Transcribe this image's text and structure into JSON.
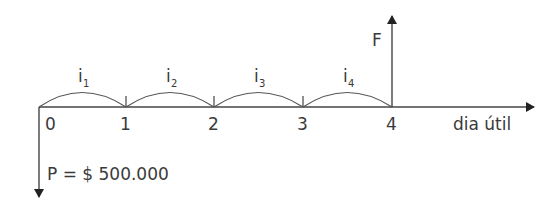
{
  "diagram": {
    "type": "cash-flow-timeline",
    "axis": {
      "label": "dia útil",
      "ticks": [
        "0",
        "1",
        "2",
        "3",
        "4"
      ]
    },
    "rates": [
      {
        "base": "i",
        "sub": "1"
      },
      {
        "base": "i",
        "sub": "2"
      },
      {
        "base": "i",
        "sub": "3"
      },
      {
        "base": "i",
        "sub": "4"
      }
    ],
    "future_value": {
      "label": "F",
      "at_period": 4
    },
    "present_value": {
      "label": "P = $ 500.000",
      "at_period": 0
    }
  }
}
